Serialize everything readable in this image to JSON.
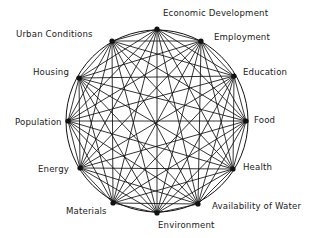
{
  "diagram": {
    "type": "complete-graph-circle",
    "stroke_color": "#111111",
    "background": "#ffffff",
    "circle": {
      "cx": 157,
      "cy": 121,
      "r": 91
    },
    "nodes": [
      {
        "id": "economic-development",
        "label": "Economic Development",
        "x": 157,
        "y": 29,
        "label_x": 163,
        "label_y": 8
      },
      {
        "id": "employment",
        "label": "Employment",
        "x": 201,
        "y": 41,
        "label_x": 214,
        "label_y": 32
      },
      {
        "id": "education",
        "label": "Education",
        "x": 234,
        "y": 76,
        "label_x": 243,
        "label_y": 67
      },
      {
        "id": "food",
        "label": "Food",
        "x": 246,
        "y": 121,
        "label_x": 254,
        "label_y": 115
      },
      {
        "id": "health",
        "label": "Health",
        "x": 233,
        "y": 169,
        "label_x": 243,
        "label_y": 162
      },
      {
        "id": "availability-of-water",
        "label": "Availability of Water",
        "x": 198,
        "y": 204,
        "label_x": 212,
        "label_y": 201
      },
      {
        "id": "environment",
        "label": "Environment",
        "x": 157,
        "y": 213,
        "label_x": 158,
        "label_y": 220
      },
      {
        "id": "materials",
        "label": "Materials",
        "x": 113,
        "y": 203,
        "label_x": 66,
        "label_y": 206
      },
      {
        "id": "energy",
        "label": "Energy",
        "x": 80,
        "y": 168,
        "label_x": 38,
        "label_y": 164
      },
      {
        "id": "population",
        "label": "Population",
        "x": 68,
        "y": 121,
        "label_x": 15,
        "label_y": 117
      },
      {
        "id": "housing",
        "label": "Housing",
        "x": 79,
        "y": 78,
        "label_x": 33,
        "label_y": 67
      },
      {
        "id": "urban-conditions",
        "label": "Urban Conditions",
        "x": 112,
        "y": 41,
        "label_x": 16,
        "label_y": 29
      }
    ]
  }
}
